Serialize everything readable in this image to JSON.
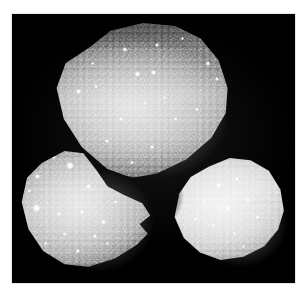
{
  "page": {
    "background_color": "#ffffff",
    "width": 307,
    "height": 299
  },
  "figure": {
    "name": "three-grains-micrograph",
    "caption": "",
    "media_type": "grayscale-photograph",
    "background_color": "#000000",
    "plate": {
      "left": 12,
      "top": 14,
      "width": 283,
      "height": 269
    },
    "palette": {
      "field": "#000000",
      "grain_dark": "#5c5c5c",
      "grain_mid": "#9b9b9b",
      "grain_light": "#cfcfcf",
      "grain_highlight": "#ffffff",
      "page": "#ffffff"
    },
    "specimens": [
      {
        "id": "specimen-top",
        "label": "",
        "position": "upper-centre",
        "relative_size": "large",
        "shape": "rounded-irregular-polygon",
        "surface": "granular, speckled",
        "shading": "dark rim at top, bright centre-left",
        "bounds": {
          "left": 53,
          "top": 23,
          "width": 180,
          "height": 155
        }
      },
      {
        "id": "specimen-left",
        "label": "",
        "position": "lower-left",
        "relative_size": "medium",
        "shape": "rounded-irregular-polygon with notched right flank",
        "surface": "granular with bright specular points",
        "shading": "bright upper-left, darker lower rim",
        "bounds": {
          "left": 19,
          "top": 146,
          "width": 134,
          "height": 122
        }
      },
      {
        "id": "specimen-right",
        "label": "",
        "position": "lower-right",
        "relative_size": "small",
        "shape": "rounded triangle",
        "surface": "smooth, finely granular",
        "shading": "uniformly bright, soft dark rim",
        "bounds": {
          "left": 170,
          "top": 156,
          "width": 115,
          "height": 105
        }
      }
    ],
    "highlights": {
      "specimen_top": [
        {
          "x": 40,
          "y": 17,
          "size": 2.6
        },
        {
          "x": 58,
          "y": 14,
          "size": 2.2
        },
        {
          "x": 72,
          "y": 10,
          "size": 2.0
        },
        {
          "x": 47,
          "y": 33,
          "size": 3.0
        },
        {
          "x": 56,
          "y": 32,
          "size": 2.8
        },
        {
          "x": 86,
          "y": 26,
          "size": 2.4
        },
        {
          "x": 91,
          "y": 36,
          "size": 2.2
        },
        {
          "x": 14,
          "y": 44,
          "size": 2.6
        },
        {
          "x": 24,
          "y": 41,
          "size": 1.8
        },
        {
          "x": 62,
          "y": 48,
          "size": 2.0
        },
        {
          "x": 51,
          "y": 52,
          "size": 1.8
        },
        {
          "x": 38,
          "y": 62,
          "size": 2.2
        },
        {
          "x": 68,
          "y": 62,
          "size": 1.8
        },
        {
          "x": 80,
          "y": 56,
          "size": 1.8
        },
        {
          "x": 30,
          "y": 76,
          "size": 2.0
        },
        {
          "x": 55,
          "y": 80,
          "size": 1.8
        },
        {
          "x": 44,
          "y": 90,
          "size": 1.8
        },
        {
          "x": 22,
          "y": 26,
          "size": 1.6
        }
      ],
      "specimen_left": [
        {
          "x": 38,
          "y": 16,
          "size": 4.2
        },
        {
          "x": 14,
          "y": 25,
          "size": 2.8
        },
        {
          "x": 26,
          "y": 9,
          "size": 2.0
        },
        {
          "x": 52,
          "y": 33,
          "size": 2.8
        },
        {
          "x": 13,
          "y": 51,
          "size": 4.0
        },
        {
          "x": 30,
          "y": 56,
          "size": 2.2
        },
        {
          "x": 47,
          "y": 54,
          "size": 2.4
        },
        {
          "x": 63,
          "y": 62,
          "size": 2.2
        },
        {
          "x": 72,
          "y": 46,
          "size": 2.0
        },
        {
          "x": 57,
          "y": 74,
          "size": 2.0
        },
        {
          "x": 34,
          "y": 72,
          "size": 1.8
        },
        {
          "x": 20,
          "y": 80,
          "size": 1.8
        },
        {
          "x": 44,
          "y": 86,
          "size": 1.8
        },
        {
          "x": 66,
          "y": 80,
          "size": 1.6
        },
        {
          "x": 8,
          "y": 37,
          "size": 1.8
        }
      ],
      "specimen_right": [
        {
          "x": 42,
          "y": 28,
          "size": 2.4
        },
        {
          "x": 58,
          "y": 22,
          "size": 2.0
        },
        {
          "x": 30,
          "y": 44,
          "size": 2.0
        },
        {
          "x": 50,
          "y": 50,
          "size": 2.2
        },
        {
          "x": 68,
          "y": 42,
          "size": 1.8
        },
        {
          "x": 76,
          "y": 58,
          "size": 1.8
        },
        {
          "x": 38,
          "y": 66,
          "size": 1.8
        },
        {
          "x": 56,
          "y": 74,
          "size": 1.8
        },
        {
          "x": 22,
          "y": 60,
          "size": 1.6
        },
        {
          "x": 64,
          "y": 86,
          "size": 1.6
        }
      ]
    }
  }
}
